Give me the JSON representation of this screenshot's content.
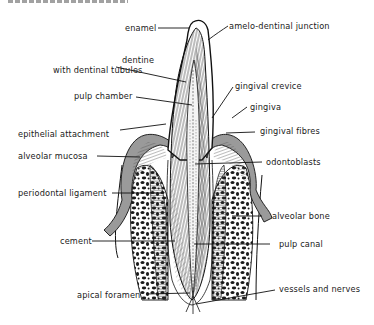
{
  "diagram": {
    "labels": {
      "enamel": "enamel",
      "amelo_dentinal_junction": "amelo-dentinal junction",
      "dentine_line1": "dentine",
      "dentine_line2": "with dentinal tubules",
      "pulp_chamber": "pulp chamber",
      "gingival_crevice": "gingival crevice",
      "gingiva": "gingiva",
      "epithelial_attachment": "epithelial attachment",
      "gingival_fibres": "gingival fibres",
      "alveolar_mucosa": "alveolar mucosa",
      "odontoblasts": "odontoblasts",
      "periodontal_ligament": "periodontal ligament",
      "alveolar_bone": "alveolar bone",
      "cement": "cement",
      "pulp_canal": "pulp canal",
      "vessels_and_nerves": "vessels and nerves",
      "apical_foramen": "apical foramen"
    },
    "colors": {
      "ink": "#1a1a1a",
      "gingiva_fill": "#9a9a9a",
      "background": "#ffffff"
    }
  }
}
